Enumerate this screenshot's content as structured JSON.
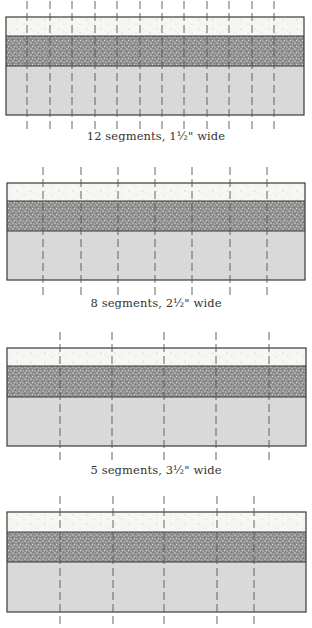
{
  "colors": {
    "outline": "#3a3a3a",
    "light_band": "#f6f6f3",
    "dark_band": "#8c8c8c",
    "grey_band": "#d9d9d9",
    "cut_line": "#555555",
    "caption": "#333333"
  },
  "panels": [
    {
      "caption": "12 segments, 1½\" wide",
      "segments": 12,
      "box": {
        "x": 6,
        "y": 17,
        "w": 298,
        "h": 98
      },
      "bands": {
        "light_end": 36,
        "dark_end": 66
      },
      "cut_lines_x": [
        27,
        50,
        72,
        95,
        117,
        140,
        162,
        184,
        207,
        229,
        252,
        274
      ],
      "caption_y": 129
    },
    {
      "caption": "8 segments, 2½\" wide",
      "segments": 8,
      "box": {
        "x": 7,
        "y": 183,
        "w": 298,
        "h": 97
      },
      "bands": {
        "light_end": 201,
        "dark_end": 231
      },
      "cut_lines_x": [
        43,
        81,
        118,
        155,
        192,
        230,
        267
      ],
      "caption_y": 296
    },
    {
      "caption": "5 segments, 3½\" wide",
      "segments": 5,
      "box": {
        "x": 7,
        "y": 348,
        "w": 299,
        "h": 98
      },
      "bands": {
        "light_end": 366,
        "dark_end": 397
      },
      "cut_lines_x": [
        60,
        112,
        164,
        216,
        269
      ],
      "caption_y": 463
    },
    {
      "caption": "",
      "segments": null,
      "box": {
        "x": 7,
        "y": 512,
        "w": 299,
        "h": 100
      },
      "bands": {
        "light_end": 532,
        "dark_end": 562
      },
      "cut_lines_x": [
        60,
        113,
        164,
        217,
        254
      ],
      "caption_y": 622
    }
  ]
}
